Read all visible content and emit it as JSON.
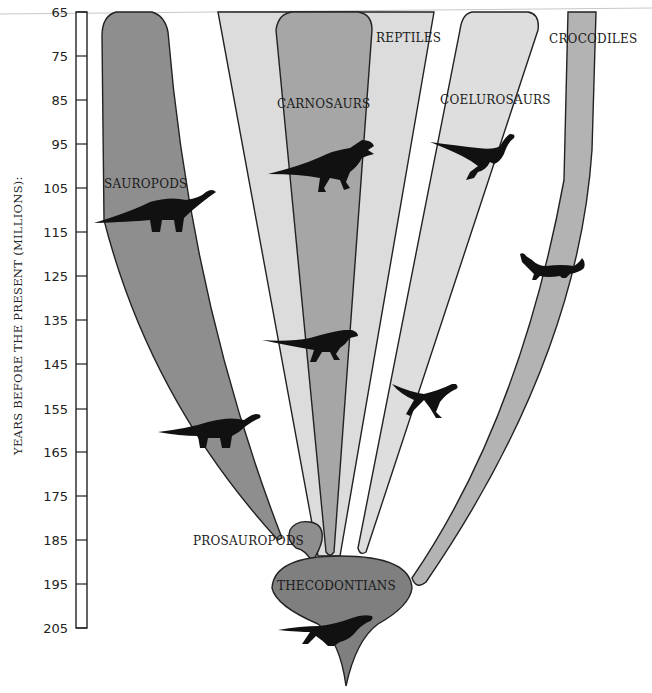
{
  "diagram": {
    "axis": {
      "title": "YEARS BEFORE THE PRESENT (MILLIONS):",
      "ticks": [
        "65",
        "75",
        "85",
        "95",
        "105",
        "115",
        "125",
        "135",
        "145",
        "155",
        "165",
        "175",
        "185",
        "195",
        "205"
      ]
    },
    "groups": {
      "sauropods": "SAUROPODS",
      "carnosaurs": "CARNOSAURS",
      "reptiles": "REPTILES",
      "coelurosaurs": "COELUROSAURS",
      "crocodiles": "CROCODILES",
      "prosauropods": "PROSAUROPODS",
      "thecodontians": "THECODONTIANS"
    },
    "icons": {
      "sauropod_1": "sauropod-silhouette",
      "sauropod_2": "sauropod-silhouette",
      "carnosaur_1": "tyrannosaur-silhouette",
      "carnosaur_2": "carnosaur-silhouette",
      "coelurosaur_1": "coelurosaur-silhouette",
      "coelurosaur_2": "coelurosaur-silhouette",
      "crocodile": "crocodile-silhouette",
      "thecodont": "thecodont-silhouette"
    },
    "colors": {
      "dark_fill": "#8e8e8e",
      "medium_fill": "#ababab",
      "light_fill": "#dcdcdc",
      "croc_fill": "#b3b3b3",
      "thecodont_fill": "#7f7f7f",
      "silhouette": "#111111"
    }
  }
}
